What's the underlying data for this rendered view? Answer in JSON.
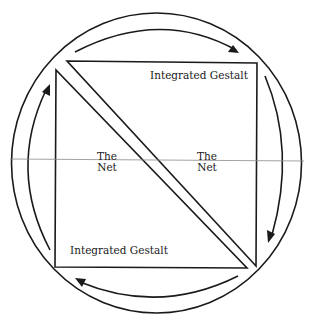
{
  "diagram": {
    "labels": {
      "upper_triangle": "Integrated  Gestalt",
      "lower_triangle": "Integrated  Gestalt",
      "net_left_line1": "The",
      "net_left_line2": "Net",
      "net_right_line1": "The",
      "net_right_line2": "Net"
    },
    "elements": {
      "outer_circle": "double concentric ring",
      "arrows": [
        "clockwise top arrow pointing right",
        "right arrow pointing down",
        "bottom arrow pointing left",
        "left arrow pointing up"
      ],
      "triangles": [
        "upper-right triangle",
        "lower-left triangle"
      ],
      "horizontal_line": "thin gray divider through the middle"
    },
    "colors": {
      "stroke": "#1a1a1a",
      "divider": "#8a8a8a",
      "background": "#ffffff"
    }
  }
}
